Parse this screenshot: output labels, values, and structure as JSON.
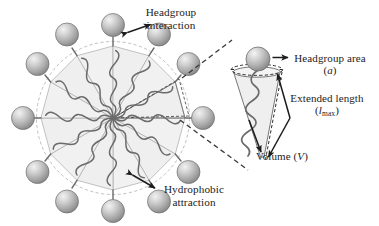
{
  "figure": {
    "kind": "surfactant-micelle-packing-parameter-diagram",
    "background_color": "#ffffff"
  },
  "labels": {
    "headgroup_interaction": {
      "line1": "Headgroup",
      "line2": "interaction"
    },
    "hydrophobic_attraction": {
      "line1": "Hydrophobic",
      "line2": "attraction"
    },
    "headgroup_area": {
      "line1": "Headgroup area",
      "symbol_open": "(",
      "symbol": "a",
      "symbol_close": ")"
    },
    "extended_length": {
      "line1": "Extended length",
      "symbol_open": "(",
      "symbol": "l",
      "symbol_sub": "max",
      "symbol_close": ")"
    },
    "volume": {
      "text_prefix": "Volume (",
      "symbol": "V",
      "text_suffix": ")"
    }
  },
  "icons": {
    "headgroup_sphere": "sphere-icon",
    "hydrophobic_tail": "wavy-tail-icon",
    "double_headed_arrow": "double-arrow-icon",
    "leader_arrow": "arrow-icon",
    "callout_line": "dashed-leader-line-icon"
  },
  "colors": {
    "sphere_light": "#e8e8e8",
    "sphere_mid": "#b6b6b6",
    "sphere_dark": "#8a8a8a",
    "sphere_stroke": "#6e6e6e",
    "wedge_fill": "#f1f1f1",
    "wedge_stroke": "#a9a9a9",
    "tail_stroke": "#6b6b6b",
    "dash_stroke": "#3a3a3a",
    "arrow_stroke": "#1c1c1c",
    "text": "#1c1c1c"
  },
  "micelle": {
    "center_x": 113,
    "center_y": 118,
    "polygon_radius": 72,
    "wedge_count": 12,
    "headgroup_count": 12,
    "headgroup_orbit_radius": 90,
    "headgroup_radius": 11.5
  },
  "cone": {
    "apex_x": 262,
    "apex_y": 158,
    "top_left_x": 232,
    "top_right_x": 281,
    "top_y": 70,
    "headgroup_center_x": 258,
    "headgroup_center_y": 59,
    "headgroup_radius": 12
  }
}
